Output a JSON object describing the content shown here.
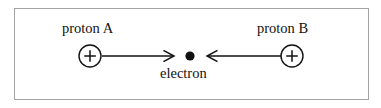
{
  "figure": {
    "type": "physics-force-diagram",
    "border_color": "#a3a3a3",
    "background_color": "#ffffff",
    "stroke_color": "#121212",
    "labels": {
      "proton_a": "proton A",
      "proton_b": "proton B",
      "electron": "electron"
    },
    "particles": [
      {
        "name": "proton-a",
        "symbol": "+",
        "shape": "open-circle",
        "cx": 90,
        "cy": 56,
        "r": 11
      },
      {
        "name": "electron",
        "symbol": "",
        "shape": "filled-dot",
        "cx": 190,
        "cy": 56,
        "r": 4.6
      },
      {
        "name": "proton-b",
        "symbol": "+",
        "shape": "open-circle",
        "cx": 292,
        "cy": 56,
        "r": 11
      }
    ],
    "arrows": [
      {
        "name": "force-arrow-left",
        "direction": "right",
        "x1": 102,
        "x2": 174,
        "y": 56
      },
      {
        "name": "force-arrow-right",
        "direction": "left",
        "x1": 280,
        "x2": 207,
        "y": 56
      }
    ]
  }
}
